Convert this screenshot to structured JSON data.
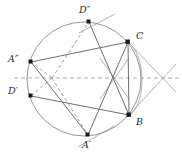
{
  "figure": {
    "width": 182,
    "height": 159,
    "background": "#ffffff"
  },
  "style": {
    "circle_stroke": "#8a8a8a",
    "chord_stroke": "#6e6e6e",
    "dashed_stroke": "#9a9a9a",
    "axis_stroke": "#9a9a9a",
    "tangent_stroke": "#a0a0a0",
    "marker_fill": "#1a1a1a",
    "label_color": "#2b2b2b"
  },
  "circle": {
    "name": "main-circle",
    "cx": 84,
    "cy": 79,
    "r": 57,
    "stroke_width": 0.9
  },
  "arc": {
    "name": "secondary-arc",
    "description": "right-side arc passing near C and B",
    "d": "M 128 42 C 146 55 147 103 129 116"
  },
  "axis": {
    "name": "horizontal-axis",
    "x1": 14,
    "y1": 78,
    "x2": 180,
    "y2": 78,
    "dash": "4,3"
  },
  "points": [
    {
      "id": "A2",
      "label": "A″",
      "x": 31,
      "y": 62,
      "label_dx": -17,
      "label_dy": -11,
      "marker": true
    },
    {
      "id": "D2",
      "label": "D″",
      "x": 89,
      "y": 22,
      "label_dx": -5,
      "label_dy": -13,
      "marker": true
    },
    {
      "id": "C",
      "label": "C",
      "x": 128,
      "y": 42,
      "label_dx": 6,
      "label_dy": -10,
      "marker": true
    },
    {
      "id": "B",
      "label": "B",
      "x": 129,
      "y": 115,
      "label_dx": 6,
      "label_dy": 3,
      "marker": true
    },
    {
      "id": "A1",
      "label": "A′",
      "x": 88,
      "y": 135,
      "label_dx": -4,
      "label_dy": 5,
      "marker": true
    },
    {
      "id": "D1",
      "label": "D′",
      "x": 31,
      "y": 96,
      "label_dx": -17,
      "label_dy": -10,
      "marker": true
    }
  ],
  "focus": {
    "name": "focus-point",
    "x": 52,
    "y": 78
  },
  "chords": [
    {
      "name": "chord-A2-C",
      "x1": 31,
      "y1": 62,
      "x2": 128,
      "y2": 42
    },
    {
      "name": "chord-D1-B",
      "x1": 31,
      "y1": 96,
      "x2": 129,
      "y2": 115
    },
    {
      "name": "chord-D2-B",
      "x1": 89,
      "y1": 22,
      "x2": 129,
      "y2": 115
    },
    {
      "name": "chord-C-A1",
      "x1": 128,
      "y1": 42,
      "x2": 88,
      "y2": 135
    },
    {
      "name": "chord-C-B",
      "x1": 128,
      "y1": 42,
      "x2": 129,
      "y2": 115
    },
    {
      "name": "chord-A2-A1",
      "x1": 31,
      "y1": 62,
      "x2": 88,
      "y2": 135
    }
  ],
  "dashed_rays": [
    {
      "name": "ray-focus-A2",
      "x1": 52,
      "y1": 78,
      "x2": 31,
      "y2": 62
    },
    {
      "name": "ray-focus-D2",
      "x1": 52,
      "y1": 78,
      "x2": 89,
      "y2": 22
    },
    {
      "name": "ray-focus-D1",
      "x1": 52,
      "y1": 78,
      "x2": 31,
      "y2": 96
    },
    {
      "name": "ray-focus-A1",
      "x1": 52,
      "y1": 78,
      "x2": 88,
      "y2": 135
    }
  ],
  "tangents": [
    {
      "name": "tangent-at-D2",
      "x1": 79,
      "y1": 33,
      "x2": 115,
      "y2": 14
    },
    {
      "name": "tangent-at-A1",
      "x1": 78,
      "y1": 147,
      "x2": 114,
      "y2": 126
    },
    {
      "name": "tangent-from-C",
      "x1": 128,
      "y1": 42,
      "x2": 176,
      "y2": 92
    },
    {
      "name": "tangent-from-B",
      "x1": 129,
      "y1": 115,
      "x2": 176,
      "y2": 64
    },
    {
      "name": "cross-left-a",
      "x1": 100,
      "y1": 60,
      "x2": 128,
      "y2": 98
    },
    {
      "name": "cross-left-b",
      "x1": 128,
      "y1": 60,
      "x2": 100,
      "y2": 98
    }
  ],
  "intersections": [
    {
      "name": "x-mark-inner",
      "x": 113,
      "y": 78
    },
    {
      "name": "x-mark-outer",
      "x": 164,
      "y": 78
    }
  ]
}
